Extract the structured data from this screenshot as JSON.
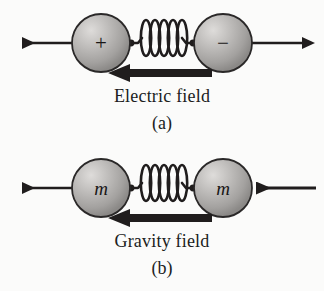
{
  "figure": {
    "background_color": "#fbfbfa",
    "ink_color": "#201d1d",
    "sphere_fill_light": "#d8d6d4",
    "sphere_fill_dark": "#8d8b89",
    "sphere_outline": "#2a2828"
  },
  "panels": [
    {
      "id": "a",
      "caption": "(a)",
      "field_label": "Electric field",
      "field_arrow_direction": "left",
      "left_sphere_label": "+",
      "right_sphere_label": "−",
      "left_force_arrow_direction": "left",
      "right_force_arrow_direction": "right",
      "spring_coils": 5
    },
    {
      "id": "b",
      "caption": "(b)",
      "field_label": "Gravity field",
      "field_arrow_direction": "left",
      "left_sphere_label": "m",
      "right_sphere_label": "m",
      "left_force_arrow_direction": "left",
      "right_force_arrow_direction": "left",
      "spring_coils": 5
    }
  ]
}
